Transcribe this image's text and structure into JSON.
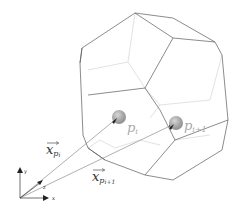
{
  "diagram": {
    "type": "voronoi-cell-polyhedron",
    "particles": [
      {
        "label": "p_i",
        "display": "p",
        "sub": "i"
      },
      {
        "label": "p_{i+1}",
        "display": "p",
        "sub": "i+1"
      }
    ],
    "vectors": [
      {
        "label": "x_{p_i}",
        "display": "x",
        "sub": "p",
        "subsub": "i"
      },
      {
        "label": "x_{p_{i+1}}",
        "display": "x",
        "sub": "p",
        "subsub": "i+1"
      }
    ],
    "axes": {
      "y": "y",
      "z": "z",
      "x": "x"
    },
    "colors": {
      "edge_front": "#555555",
      "edge_back": "#c8c8c8",
      "sphere": "#9a9a9a",
      "vector": "#777777",
      "label_particle": "#aaaaaa",
      "label_vector": "#333333"
    }
  }
}
